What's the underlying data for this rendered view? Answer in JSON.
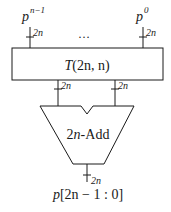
{
  "diagram": {
    "inputs": [
      {
        "base": "p",
        "superscript": "n−1",
        "width_label": "2n"
      },
      {
        "base": "p",
        "superscript": "0",
        "width_label": "2n"
      }
    ],
    "ellipsis": "…",
    "transform_block": {
      "label_func": "T",
      "label_args": "(2n, n)"
    },
    "block_outputs": [
      {
        "width_label": "2n"
      },
      {
        "width_label": "2n"
      }
    ],
    "adder": {
      "label_num": "2",
      "label_var": "n",
      "label_suffix": "-Add"
    },
    "output": {
      "width_label": "2n",
      "label_base": "p",
      "label_range": "[2n − 1 : 0]"
    },
    "colors": {
      "stroke": "#1a1a1a",
      "background": "#ffffff"
    }
  }
}
